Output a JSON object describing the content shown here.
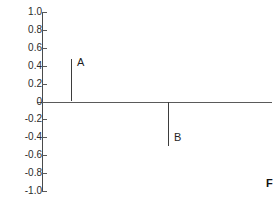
{
  "chart_data": {
    "type": "bar",
    "title": "",
    "subtitle": "",
    "xlabel": "F",
    "ylabel": "",
    "ylim": [
      -1.0,
      1.0
    ],
    "xlim": [
      0,
      1
    ],
    "grid": false,
    "legend": null,
    "categories": [
      "A",
      "B"
    ],
    "values": [
      0.47,
      -0.49
    ],
    "series": [
      {
        "name": "impulses",
        "points": [
          {
            "label": "A",
            "x_frac": 0.125,
            "value": 0.47
          },
          {
            "label": "B",
            "x_frac": 0.547,
            "value": -0.49
          }
        ]
      }
    ],
    "y_ticks": [
      {
        "value": 1.0,
        "label": "1.0"
      },
      {
        "value": 0.8,
        "label": "0.8"
      },
      {
        "value": 0.6,
        "label": "0.6"
      },
      {
        "value": 0.4,
        "label": "0.4"
      },
      {
        "value": 0.2,
        "label": "0.2"
      },
      {
        "value": 0.0,
        "label": "0"
      },
      {
        "value": -0.2,
        "label": "-0.2"
      },
      {
        "value": -0.4,
        "label": "-0.4"
      },
      {
        "value": -0.6,
        "label": "-0.6"
      },
      {
        "value": -0.8,
        "label": "-0.8"
      },
      {
        "value": -1.0,
        "label": "-1.0"
      }
    ],
    "annotations": [
      {
        "text": "A",
        "near": "positive impulse"
      },
      {
        "text": "B",
        "near": "negative impulse"
      },
      {
        "text": "F",
        "near": "bottom-right axis label"
      }
    ],
    "colors": {
      "background": "#ffffff",
      "axis": "#5a5a5a",
      "stem": "#3d3d3d",
      "text": "#1f1f1f"
    }
  }
}
